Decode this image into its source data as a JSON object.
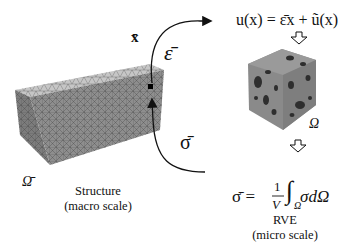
{
  "diagram": {
    "macro": {
      "label_x": "x̄",
      "label_domain": "Ω̄",
      "caption_line1": "Structure",
      "caption_line2": "(macro scale)"
    },
    "links": {
      "strain_label": "ε̄",
      "stress_label": "σ̄"
    },
    "micro": {
      "displacement_eq": "u(x) = ε̄x + ũ(x)",
      "domain_label": "Ω",
      "stress_eq_lhs": "σ̄ =",
      "stress_eq_num": "1",
      "stress_eq_den": "V",
      "stress_eq_integral": "∫",
      "stress_eq_sub": "Ω",
      "stress_eq_integrand": "σdΩ",
      "caption_line1": "RVE",
      "caption_line2": "(micro scale)"
    },
    "colors": {
      "mesh_top": "#c4c4c4",
      "mesh_front": "#8a8a8a",
      "mesh_side": "#7a7a7a",
      "rve_body": "#8c8c8c",
      "inclusions": "#333333",
      "ink": "#111111"
    }
  }
}
